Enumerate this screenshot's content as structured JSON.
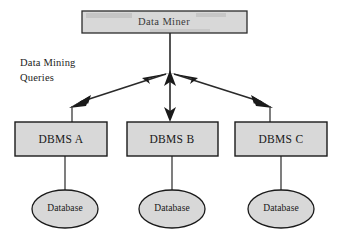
{
  "diagram": {
    "background_color": "#ffffff",
    "node_fill_color": "#d8d8d8",
    "node_stroke_color": "#1a1a1a",
    "text_color": "#171717"
  },
  "top_node": {
    "label": "Data Miner",
    "shape": "rectangle"
  },
  "side_annotation": {
    "line1": "Data Mining",
    "line2": "Queries"
  },
  "dbms_nodes": [
    {
      "label": "DBMS A",
      "shape": "rectangle"
    },
    {
      "label": "DBMS B",
      "shape": "rectangle"
    },
    {
      "label": "DBMS C",
      "shape": "rectangle"
    }
  ],
  "database_nodes": [
    {
      "label": "Database",
      "shape": "ellipse"
    },
    {
      "label": "Database",
      "shape": "ellipse"
    },
    {
      "label": "Database",
      "shape": "ellipse"
    }
  ],
  "connectors": {
    "top_to_hub": "line",
    "hub_to_dbms_a": "arrow",
    "hub_to_dbms_b": "double-arrow",
    "hub_to_dbms_c": "arrow",
    "dbms_to_database": "line"
  }
}
